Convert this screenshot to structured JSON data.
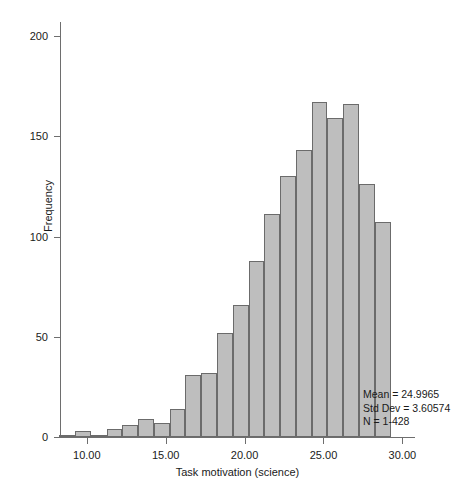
{
  "chart_data": {
    "type": "bar",
    "title": "",
    "xlabel": "Task motivation (science)",
    "ylabel": "Frequency",
    "xlim": [
      8.3,
      30.8
    ],
    "ylim": [
      0,
      207
    ],
    "grid": false,
    "legend": "none",
    "bin_width": 1.0,
    "bar_fill": "#bebebe",
    "bar_stroke": "#6b6b6b",
    "x_ticks": [
      "10.00",
      "15.00",
      "20.00",
      "25.00",
      "30.00"
    ],
    "x_tick_values": [
      10,
      15,
      20,
      25,
      30
    ],
    "y_ticks": [
      "0",
      "50",
      "100",
      "150",
      "200"
    ],
    "y_tick_values": [
      0,
      50,
      100,
      150,
      200
    ],
    "categories": [
      "8.5",
      "9.5",
      "10.5",
      "11.5",
      "12.5",
      "13.5",
      "14.5",
      "15.5",
      "16.5",
      "17.5",
      "18.5",
      "19.5",
      "20.5",
      "21.5",
      "22.5",
      "23.5",
      "24.5",
      "25.5",
      "26.5",
      "27.5",
      "28.5",
      "29.5"
    ],
    "bin_centers": [
      8.75,
      9.75,
      10.75,
      11.75,
      12.75,
      13.75,
      14.75,
      15.75,
      16.75,
      17.75,
      18.75,
      19.75,
      20.75,
      21.75,
      22.75,
      23.75,
      24.75,
      25.75,
      26.75,
      27.75,
      28.75,
      29.75
    ],
    "values": [
      1,
      3,
      1,
      4,
      6,
      9,
      7,
      14,
      31,
      32,
      52,
      66,
      88,
      111,
      130,
      143,
      167,
      159,
      166,
      126,
      107,
      0
    ]
  },
  "annotations": {
    "mean": "Mean = 24.9965",
    "std_dev": "Std Dev = 3.60574",
    "n": "N = 1-428"
  }
}
